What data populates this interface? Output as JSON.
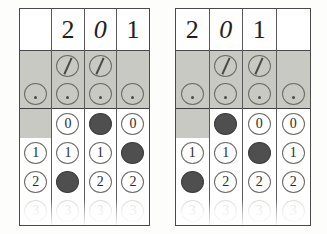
{
  "document": {
    "title": "Scanned bubble-sheet grid comparison",
    "panel_count": 2
  },
  "colors": {
    "ink": "#20201e",
    "bubble_outline": "#6b6b66",
    "bubble_filled": "#4f4f50",
    "shaded_band": "#c9c9c4",
    "rule_line": "#3f3f3f",
    "paper": "#ffffff"
  },
  "panels": [
    {
      "name": "left-panel",
      "columns": 4,
      "header": {
        "label": "handwritten-digit-row",
        "digits": [
          "",
          "2",
          "0",
          "1"
        ],
        "styles": [
          "none",
          "upright",
          "slant",
          "upright"
        ]
      },
      "rows": [
        {
          "id": "slash-row",
          "label": "slash",
          "shaded": true,
          "cells": [
            "empty",
            "slash",
            "slash",
            "empty"
          ]
        },
        {
          "id": "dot-row",
          "label": "dot",
          "shaded": true,
          "rule_below": true,
          "cells": [
            "dot",
            "dot",
            "dot",
            "dot"
          ]
        },
        {
          "id": "row-0",
          "label": "0",
          "shaded_first_column": true,
          "cells": [
            "empty",
            "open",
            "filled",
            "open"
          ]
        },
        {
          "id": "row-1",
          "label": "1",
          "shaded_first_column": false,
          "cells": [
            "open",
            "open",
            "open",
            "filled"
          ]
        },
        {
          "id": "row-2",
          "label": "2",
          "shaded_first_column": false,
          "cells": [
            "open",
            "filled",
            "open",
            "open"
          ]
        },
        {
          "id": "row-3",
          "label": "3",
          "cut_off": true,
          "cells": [
            "open",
            "open",
            "open",
            "open"
          ]
        }
      ]
    },
    {
      "name": "right-panel",
      "columns": 4,
      "header": {
        "label": "handwritten-digit-row",
        "digits": [
          "2",
          "0",
          "1",
          ""
        ],
        "styles": [
          "upright",
          "slant",
          "upright",
          "none"
        ]
      },
      "rows": [
        {
          "id": "slash-row",
          "label": "slash",
          "shaded": true,
          "cells": [
            "empty",
            "slash",
            "slash",
            "empty"
          ]
        },
        {
          "id": "dot-row",
          "label": "dot",
          "shaded": true,
          "rule_below": true,
          "cells": [
            "dot",
            "dot",
            "dot",
            "dot"
          ]
        },
        {
          "id": "row-0",
          "label": "0",
          "shaded_first_column": true,
          "cells": [
            "empty",
            "filled",
            "open",
            "open"
          ]
        },
        {
          "id": "row-1",
          "label": "1",
          "shaded_first_column": false,
          "cells": [
            "open",
            "open",
            "filled",
            "open"
          ]
        },
        {
          "id": "row-2",
          "label": "2",
          "shaded_first_column": false,
          "cells": [
            "filled",
            "open",
            "open",
            "open"
          ]
        },
        {
          "id": "row-3",
          "label": "3",
          "cut_off": true,
          "cells": [
            "open",
            "open",
            "open",
            "open"
          ]
        }
      ]
    }
  ]
}
